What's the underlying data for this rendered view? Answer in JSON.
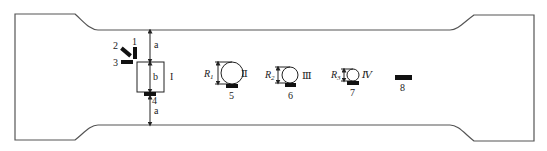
{
  "diagram": {
    "type": "specimen-sensor-layout",
    "specimen": "dog-bone tensile specimen outline",
    "dimensions": {
      "gap_top_label": "a",
      "square_height_label": "b",
      "gap_bottom_label": "a"
    },
    "defects": [
      {
        "id": "I",
        "label": "I",
        "shape": "square",
        "size_label": "b"
      },
      {
        "id": "II",
        "label": "Ⅱ",
        "shape": "circle",
        "radius_label": "R",
        "radius_sub": "1"
      },
      {
        "id": "III",
        "label": "Ⅲ",
        "shape": "circle",
        "radius_label": "R",
        "radius_sub": "2"
      },
      {
        "id": "IV",
        "label": "Ⅳ",
        "shape": "circle",
        "radius_label": "R",
        "radius_sub": "3"
      }
    ],
    "sensors": [
      {
        "id": "1",
        "label": "1"
      },
      {
        "id": "2",
        "label": "2"
      },
      {
        "id": "3",
        "label": "3"
      },
      {
        "id": "4",
        "label": "4"
      },
      {
        "id": "5",
        "label": "5"
      },
      {
        "id": "6",
        "label": "6"
      },
      {
        "id": "7",
        "label": "7"
      },
      {
        "id": "8",
        "label": "8"
      }
    ],
    "colors": {
      "outline": "#555555",
      "sensor": "#111111",
      "text": "#222222",
      "background": "#ffffff"
    }
  }
}
